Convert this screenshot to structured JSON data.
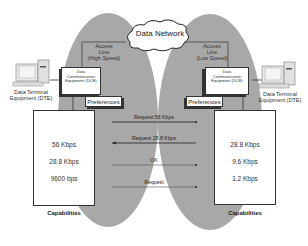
{
  "network": {
    "label": "Data Network"
  },
  "left": {
    "access_line": [
      "Access",
      "Line",
      "(High Speed)"
    ],
    "dce": [
      "Data",
      "Communication",
      "Equipment (DCE)"
    ],
    "dte": [
      "Data Terminal",
      "Equipment (DTE)"
    ],
    "preferences": "Preferences",
    "capabilities": [
      "56 Kbps",
      "28.8 Kbps",
      "9600 bps"
    ],
    "capabilities_label": "Capabilities"
  },
  "right": {
    "access_line": [
      "Access",
      "Line",
      "(Low Speed)"
    ],
    "dce": [
      "Data",
      "Communication",
      "Equipment (DCE)"
    ],
    "dte": [
      "Data Terminal",
      "Equipment (DTE)"
    ],
    "preferences": "Preferences",
    "capabilities": [
      "28.8 Kbps",
      "9.6 Kbps",
      "1.2 Kbps"
    ],
    "capabilities_label": "Capabilities"
  },
  "messages": [
    {
      "label": "Request 56 Kbps",
      "direction": "right"
    },
    {
      "label": "Request 28.8 Kbps",
      "direction": "left"
    },
    {
      "label": "OK",
      "direction": "right"
    },
    {
      "label": "Request",
      "direction": "right"
    }
  ],
  "colors": {
    "ellipse": "#a9a9a9",
    "line": "#333333",
    "box": "#ffffff"
  }
}
